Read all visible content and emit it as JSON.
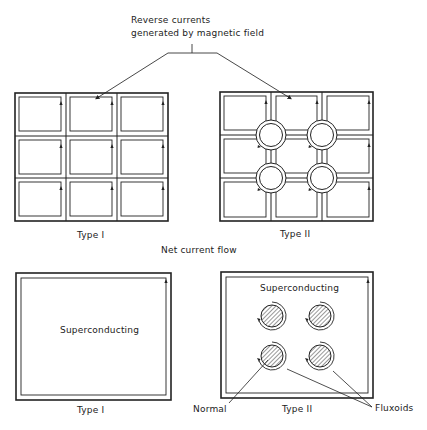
{
  "header": {
    "annotation_line1": "Reverse currents",
    "annotation_line2": "generated by magnetic field"
  },
  "top_row": {
    "type1_label": "Type I",
    "type2_label": "Type II"
  },
  "middle": {
    "net_current_label": "Net current flow"
  },
  "bottom_row": {
    "type1_label": "Type I",
    "type1_region_label": "Superconducting",
    "type2_label": "Type II",
    "type2_region_label": "Superconducting",
    "normal_label": "Normal",
    "fluxoids_label": "Fluxoids"
  },
  "colors": {
    "line": "#222222",
    "background": "#ffffff"
  }
}
